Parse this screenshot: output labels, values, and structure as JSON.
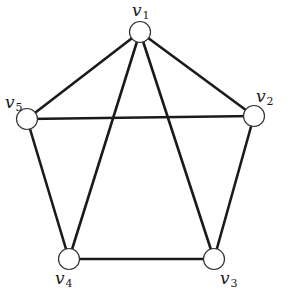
{
  "diagram": {
    "type": "graph",
    "colors": {
      "edge": "#1a1a1a",
      "node_fill": "#ffffff",
      "node_stroke": "#333333",
      "background": "#ffffff"
    },
    "nodes": [
      {
        "id": "v1",
        "letter": "v",
        "sub": "1",
        "x": 140,
        "y": 32,
        "lx": 132,
        "ly": 2
      },
      {
        "id": "v2",
        "letter": "v",
        "sub": "2",
        "x": 254,
        "y": 116,
        "lx": 256,
        "ly": 88
      },
      {
        "id": "v3",
        "letter": "v",
        "sub": "3",
        "x": 214,
        "y": 259,
        "lx": 220,
        "ly": 270
      },
      {
        "id": "v4",
        "letter": "v",
        "sub": "4",
        "x": 69,
        "y": 259,
        "lx": 55,
        "ly": 270
      },
      {
        "id": "v5",
        "letter": "v",
        "sub": "5",
        "x": 27,
        "y": 119,
        "lx": 5,
        "ly": 94
      }
    ],
    "edges": [
      [
        "v1",
        "v5"
      ],
      [
        "v1",
        "v2"
      ],
      [
        "v1",
        "v4"
      ],
      [
        "v1",
        "v3"
      ],
      [
        "v5",
        "v2"
      ],
      [
        "v5",
        "v4"
      ],
      [
        "v2",
        "v3"
      ],
      [
        "v4",
        "v3"
      ]
    ]
  }
}
